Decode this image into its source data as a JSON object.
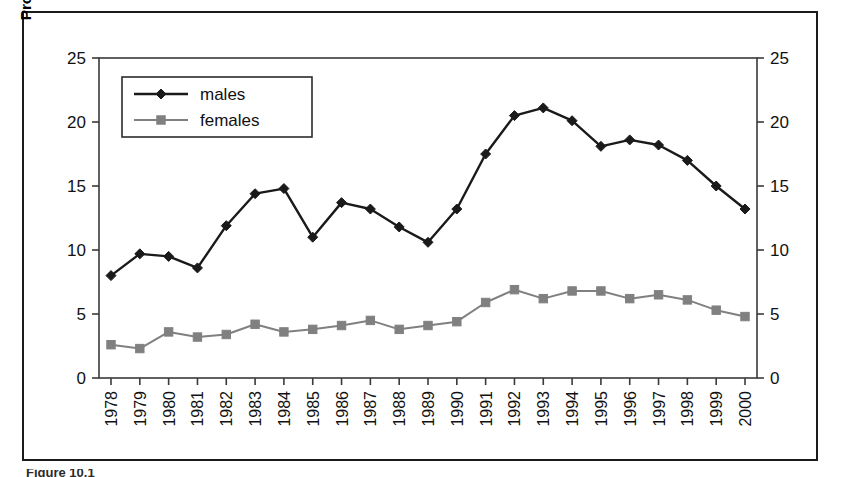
{
  "figure": {
    "caption_fragment": "Figure 10.1",
    "y_axis_title": "Proportion of part-time workers"
  },
  "chart_data": {
    "type": "line",
    "title": "",
    "xlabel": "",
    "ylabel": "Proportion of part-time workers",
    "ylim": [
      0,
      25
    ],
    "yticks": [
      0,
      5,
      10,
      15,
      20,
      25
    ],
    "y_axis_right": true,
    "yticks_right": [
      0,
      5,
      10,
      15,
      20,
      25
    ],
    "grid": false,
    "legend_position": "top-left-inside",
    "categories": [
      "1978",
      "1979",
      "1980",
      "1981",
      "1982",
      "1983",
      "1984",
      "1985",
      "1986",
      "1987",
      "1988",
      "1989",
      "1990",
      "1991",
      "1992",
      "1993",
      "1994",
      "1995",
      "1996",
      "1997",
      "1998",
      "1999",
      "2000"
    ],
    "series": [
      {
        "name": "males",
        "color": "#1a1a1a",
        "marker": "diamond",
        "values": [
          8.0,
          9.7,
          9.5,
          8.6,
          11.9,
          14.4,
          14.8,
          11.0,
          13.7,
          13.2,
          11.8,
          10.6,
          13.2,
          17.5,
          20.5,
          21.1,
          20.1,
          18.1,
          18.6,
          18.2,
          17.0,
          15.0,
          13.2
        ]
      },
      {
        "name": "females",
        "color": "#808080",
        "marker": "square",
        "values": [
          2.6,
          2.3,
          3.6,
          3.2,
          3.4,
          4.2,
          3.6,
          3.8,
          4.1,
          4.5,
          3.8,
          4.1,
          4.4,
          5.9,
          6.9,
          6.2,
          6.8,
          6.8,
          6.2,
          6.5,
          6.1,
          5.3,
          4.8
        ]
      }
    ]
  }
}
